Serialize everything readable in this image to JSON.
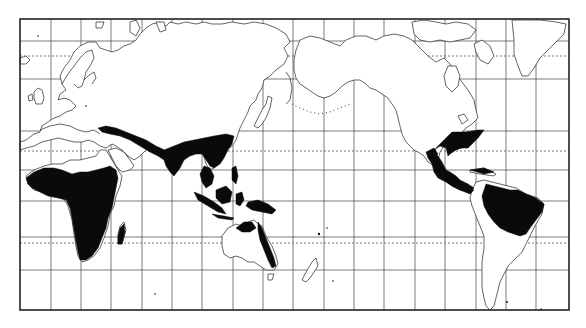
{
  "map": {
    "type": "world distribution map",
    "projection": "Mercator, Pacific-centered",
    "frame": {
      "left": 20,
      "top": 19,
      "right": 569,
      "bottom": 310
    },
    "colors": {
      "background": "#ffffff",
      "land_outline": "#222222",
      "range_fill": "#0a0a0a",
      "grid": "#444444"
    },
    "grid": {
      "meridians_x": [
        51,
        81,
        111,
        142,
        172,
        202,
        233,
        263,
        293,
        324,
        354,
        384,
        415,
        445,
        476,
        506,
        536
      ],
      "parallels_y": [
        41,
        79,
        131,
        170,
        201,
        237,
        270
      ],
      "dashed_parallels": [
        {
          "name": "arctic-circle",
          "y": 56
        },
        {
          "name": "tropic-of-cancer",
          "y": 151
        },
        {
          "name": "tropic-of-capricorn",
          "y": 243
        }
      ]
    },
    "shaded_regions": [
      {
        "name": "africa-sub-saharan"
      },
      {
        "name": "madagascar"
      },
      {
        "name": "middle-east-to-south-asia-band"
      },
      {
        "name": "india"
      },
      {
        "name": "southeast-asia"
      },
      {
        "name": "maritime-southeast-asia"
      },
      {
        "name": "new-guinea"
      },
      {
        "name": "northern-and-eastern-australia"
      },
      {
        "name": "southeastern-north-america"
      },
      {
        "name": "central-america-and-caribbean"
      },
      {
        "name": "northern-south-america"
      }
    ],
    "legend": null,
    "labels": []
  }
}
